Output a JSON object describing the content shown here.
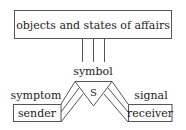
{
  "diagram": {
    "top_box": {
      "label": "objects and states of affairs"
    },
    "center": {
      "label": "symbol",
      "glyph": "S"
    },
    "left": {
      "relation_label": "symptom",
      "box_label": "sender"
    },
    "right": {
      "relation_label": "signal",
      "box_label": "receiver"
    },
    "colors": {
      "stroke": "#555555",
      "text": "#222222",
      "background": "#ffffff"
    }
  }
}
